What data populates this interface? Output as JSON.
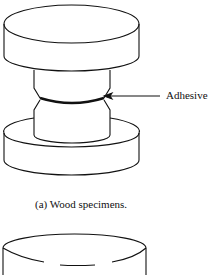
{
  "figure": {
    "annotation": "Adhesive",
    "caption": "(a)  Wood specimens.",
    "line_color": "#111111",
    "background": "#ffffff"
  },
  "parts": [
    {
      "name": "top-disc"
    },
    {
      "name": "upper-neck"
    },
    {
      "name": "adhesive-layer"
    },
    {
      "name": "lower-neck"
    },
    {
      "name": "bottom-disc"
    },
    {
      "name": "second-specimen-disc"
    }
  ]
}
